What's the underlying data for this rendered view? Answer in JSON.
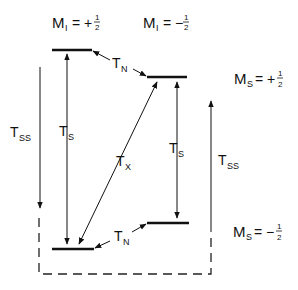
{
  "diagram": {
    "type": "energy-level-diagram",
    "column_headers": [
      {
        "main": "M",
        "sub": "I",
        "eq": "= +",
        "frac_num": "1",
        "frac_den": "2"
      },
      {
        "main": "M",
        "sub": "I",
        "eq": "= −",
        "frac_num": "1",
        "frac_den": "2"
      }
    ],
    "row_labels": [
      {
        "main": "M",
        "sub": "S",
        "eq": "= +",
        "frac_num": "1",
        "frac_den": "2"
      },
      {
        "main": "M",
        "sub": "S",
        "eq": "= −",
        "frac_num": "1",
        "frac_den": "2"
      }
    ],
    "transitions": {
      "tss_left": {
        "main": "T",
        "sub": "SS"
      },
      "tss_right": {
        "main": "T",
        "sub": "SS"
      },
      "ts_left": {
        "main": "T",
        "sub": "S"
      },
      "ts_right": {
        "main": "T",
        "sub": "S"
      },
      "tx": {
        "main": "T",
        "sub": "X"
      },
      "tn_top": {
        "main": "T",
        "sub": "N"
      },
      "tn_bottom": {
        "main": "T",
        "sub": "N"
      }
    },
    "levels": [
      {
        "name": "MI+1/2, MS+1/2",
        "x1": 52,
        "x2": 92,
        "y": 50
      },
      {
        "name": "MI-1/2, MS+1/2",
        "x1": 147,
        "x2": 187,
        "y": 77
      },
      {
        "name": "MI-1/2, MS-1/2",
        "x1": 147,
        "x2": 189,
        "y": 223
      },
      {
        "name": "MI+1/2, MS-1/2",
        "x1": 52,
        "x2": 94,
        "y": 249
      }
    ]
  }
}
